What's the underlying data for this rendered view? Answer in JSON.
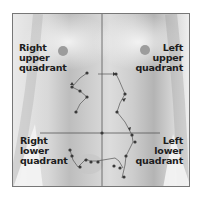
{
  "diagram": {
    "quadrants": [
      {
        "id": "ruq",
        "lines": [
          "Right",
          "upper",
          "quadrant"
        ]
      },
      {
        "id": "luq",
        "lines": [
          "Left",
          "upper",
          "quadrant"
        ]
      },
      {
        "id": "rlq",
        "lines": [
          "Right",
          "lower",
          "quadrant"
        ]
      },
      {
        "id": "llq",
        "lines": [
          "Left",
          "lower",
          "quadrant"
        ]
      }
    ],
    "colors": {
      "frame": "#777777",
      "divider": "#555555",
      "dot": "#3a3a3a",
      "label": "#1c1c1c"
    }
  }
}
